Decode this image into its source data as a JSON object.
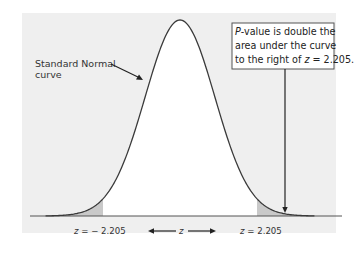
{
  "chart_data": {
    "type": "area",
    "title": "",
    "distribution": "Standard Normal",
    "x": [
      -3.5,
      -3,
      -2.5,
      -2.205,
      -2,
      -1.5,
      -1,
      -0.5,
      0,
      0.5,
      1,
      1.5,
      2,
      2.205,
      2.5,
      3,
      3.5
    ],
    "density": [
      0.0009,
      0.0044,
      0.0175,
      0.0351,
      0.054,
      0.1295,
      0.242,
      0.3521,
      0.3989,
      0.3521,
      0.242,
      0.1295,
      0.054,
      0.0351,
      0.0175,
      0.0044,
      0.0009
    ],
    "shaded_regions": [
      {
        "from": "-inf",
        "to": -2.205,
        "label": "left tail"
      },
      {
        "from": 2.205,
        "to": "inf",
        "label": "right tail"
      }
    ],
    "critical_values": [
      -2.205,
      2.205
    ],
    "xlabel": "z",
    "ylabel": "",
    "grid": false,
    "legend": null,
    "annotations": [
      "Standard Normal curve",
      "P-value is double the area under the curve to the right of z = 2.205."
    ]
  },
  "labels": {
    "curve_label_line1": "Standard Normal",
    "curve_label_line2": "curve",
    "callout_p": "P",
    "callout_line1_rest": "-value is double the",
    "callout_line2": "area under the curve",
    "callout_line3_a": "to the right of ",
    "callout_line3_z": "z",
    "callout_line3_b": " = 2.205.",
    "left_z_var": "z",
    "left_z_val": " = − 2.205",
    "axis_var": "z",
    "right_z_var": "z",
    "right_z_val": " = 2.205"
  },
  "colors": {
    "panel": "#efefef",
    "tail_shade": "#c9c9c9",
    "curve": "#3a3a3a"
  }
}
